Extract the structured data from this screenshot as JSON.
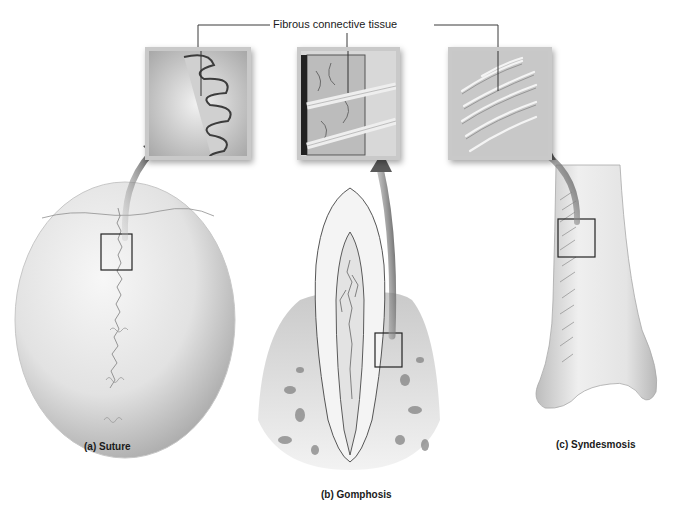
{
  "figure": {
    "top_label": "Fibrous connective tissue",
    "panels": [
      {
        "id": "a",
        "label": "(a)  Suture",
        "structure": "skull",
        "inset": "suture-detail"
      },
      {
        "id": "b",
        "label": "(b)  Gomphosis",
        "structure": "tooth-in-socket",
        "inset": "periodontal-ligament-detail"
      },
      {
        "id": "c",
        "label": "(c) Syndesmosis",
        "structure": "tibia-fibula-distal",
        "inset": "interosseous-membrane-detail"
      }
    ],
    "colors": {
      "background": "#ffffff",
      "bone": "#e6e6e6",
      "bone_shadow": "#b5b5b5",
      "arrow": "#6e6e6e",
      "line": "#333333",
      "text": "#1a1a1a"
    }
  }
}
